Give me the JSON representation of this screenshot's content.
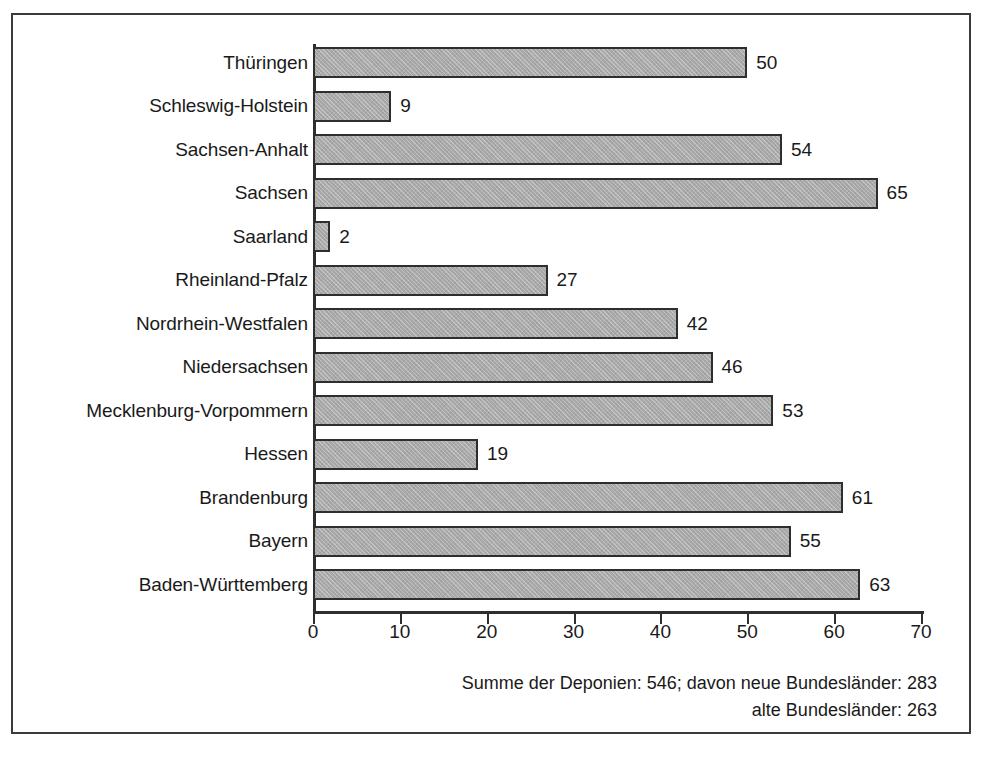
{
  "chart_data": {
    "type": "bar",
    "orientation": "horizontal",
    "title": "",
    "subtitle": "",
    "xlabel": "",
    "ylabel": "",
    "xlim": [
      0,
      70
    ],
    "xticks": [
      0,
      10,
      20,
      30,
      40,
      50,
      60,
      70
    ],
    "xtick_labels": [
      "0",
      "10",
      "20",
      "30",
      "40",
      "50",
      "60",
      "70"
    ],
    "grid": false,
    "legend": null,
    "bar_labels_shown": true,
    "categories": [
      "Thüringen",
      "Schleswig-Holstein",
      "Sachsen-Anhalt",
      "Sachsen",
      "Saarland",
      "Rheinland-Pfalz",
      "Nordrhein-Westfalen",
      "Niedersachsen",
      "Mecklenburg-Vorpommern",
      "Hessen",
      "Brandenburg",
      "Bayern",
      "Baden-Württemberg"
    ],
    "values": [
      50,
      9,
      54,
      65,
      2,
      27,
      42,
      46,
      53,
      19,
      61,
      55,
      63
    ],
    "value_labels": [
      "50",
      "9",
      "54",
      "65",
      "2",
      "27",
      "42",
      "46",
      "53",
      "19",
      "61",
      "55",
      "63"
    ],
    "bar_color": "#a9a9a9",
    "bar_edge_color": "#2e2e2e",
    "axis_color": "#2e2e2e",
    "background_color": "#ffffff",
    "annotations": [
      "Summe der Deponien: 546; davon neue Bundesländer: 283",
      "alte Bundesländer: 263"
    ]
  },
  "footer": {
    "line1": "Summe der Deponien: 546; davon neue Bundesländer: 283",
    "line2": "alte Bundesländer: 263"
  }
}
